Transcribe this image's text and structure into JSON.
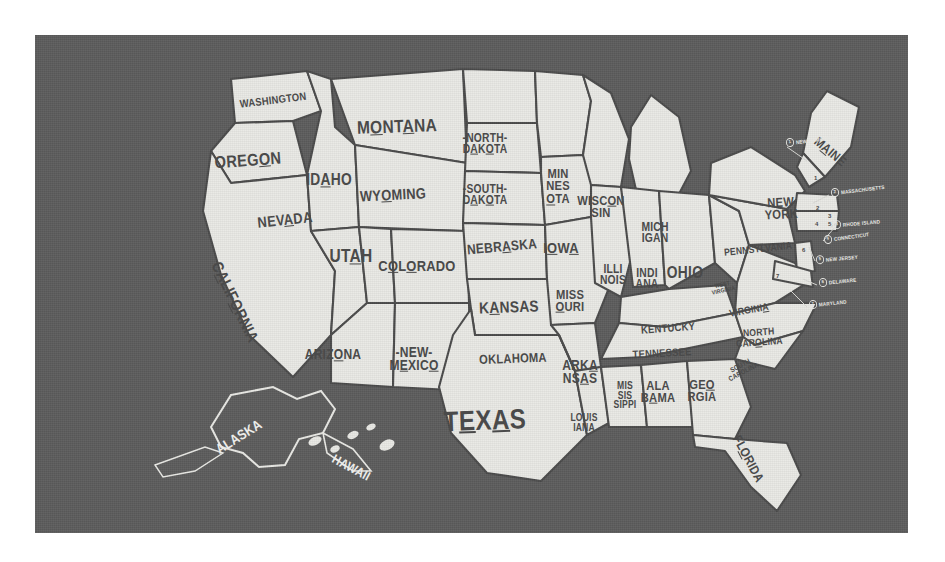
{
  "poster": {
    "title": "United States Hand-Lettered Map",
    "background_color": "#5c5c5c",
    "land_color": "#e9e9e5",
    "ink_color": "#4a4a4a",
    "inset_label_color": "#ececea",
    "margin_color": "#ffffff"
  },
  "map_data": {
    "type": "map",
    "projection": "United States (contiguous) with Alaska and Hawaii insets",
    "style": "vintage hand-lettered poster, condensed sans capitals with selected letters underlined",
    "state_count": 50,
    "states": [
      {
        "name": "WASHINGTON",
        "lines": [
          "WASHINGTON"
        ],
        "x": 238,
        "y": 65,
        "size": 11,
        "rot": -7
      },
      {
        "name": "OREGON",
        "lines": [
          "OREG<u>O</u>N"
        ],
        "x": 213,
        "y": 126,
        "size": 17,
        "rot": -4
      },
      {
        "name": "IDAHO",
        "lines": [
          "ID<u>A</u>HO"
        ],
        "x": 294,
        "y": 145,
        "size": 16,
        "rot": 0
      },
      {
        "name": "MONTANA",
        "lines": [
          "M<u>O</u>NT<u>A</u>NA"
        ],
        "x": 362,
        "y": 92,
        "size": 18,
        "rot": -2
      },
      {
        "name": "WYOMING",
        "lines": [
          "WY<u>O</u>MING"
        ],
        "x": 358,
        "y": 160,
        "size": 15,
        "rot": -3
      },
      {
        "name": "NEVADA",
        "lines": [
          "NEV<u>A</u>DA"
        ],
        "x": 250,
        "y": 185,
        "size": 15,
        "rot": -6
      },
      {
        "name": "CALIFORNIA",
        "lines": [
          "C<u>A</u>LIF<u>O</u>RNIA"
        ],
        "x": 200,
        "y": 267,
        "size": 16,
        "rot": 64
      },
      {
        "name": "UTAH",
        "lines": [
          "UT<u>A</u>H"
        ],
        "x": 316,
        "y": 222,
        "size": 18,
        "rot": 0
      },
      {
        "name": "ARIZONA",
        "lines": [
          "ARIZ<u>O</u>NA"
        ],
        "x": 298,
        "y": 320,
        "size": 14,
        "rot": 0
      },
      {
        "name": "COLORADO",
        "lines": [
          "C<u>O</u>L<u>O</u>RADO"
        ],
        "x": 382,
        "y": 231,
        "size": 15,
        "rot": 0
      },
      {
        "name": "NEW MEXICO",
        "lines": [
          "-NEW-",
          "M<u>E</u>XIC<u>O</u>"
        ],
        "x": 379,
        "y": 324,
        "size": 14,
        "rot": 0
      },
      {
        "name": "NORTH DAKOTA",
        "lines": [
          "-NORTH-",
          "D<u>A</u>K<u>O</u>TA"
        ],
        "x": 450,
        "y": 109,
        "size": 12,
        "rot": 0
      },
      {
        "name": "SOUTH DAKOTA",
        "lines": [
          "-SOUTH-",
          "D<u>A</u>K<u>O</u>TA"
        ],
        "x": 450,
        "y": 160,
        "size": 12,
        "rot": 0
      },
      {
        "name": "NEBRASKA",
        "lines": [
          "NEBR<u>A</u>SKA"
        ],
        "x": 467,
        "y": 212,
        "size": 14,
        "rot": -5
      },
      {
        "name": "KANSAS",
        "lines": [
          "K<u>A</u>NSAS"
        ],
        "x": 474,
        "y": 272,
        "size": 16,
        "rot": -2
      },
      {
        "name": "OKLAHOMA",
        "lines": [
          "OKLAHOMA"
        ],
        "x": 478,
        "y": 324,
        "size": 13,
        "rot": -2
      },
      {
        "name": "TEXAS",
        "lines": [
          "T<u>E</u>X<u>A</u>S"
        ],
        "x": 450,
        "y": 386,
        "size": 28,
        "rot": -2
      },
      {
        "name": "MINNESOTA",
        "lines": [
          "MIN",
          "NES",
          "<u>O</u>TA"
        ],
        "x": 523,
        "y": 152,
        "size": 13,
        "rot": 0
      },
      {
        "name": "IOWA",
        "lines": [
          "I<u>O</u>W<u>A</u>"
        ],
        "x": 526,
        "y": 213,
        "size": 15,
        "rot": 0
      },
      {
        "name": "MISSOURI",
        "lines": [
          "MISS",
          "<u>O</u>URI"
        ],
        "x": 535,
        "y": 266,
        "size": 13,
        "rot": 0
      },
      {
        "name": "ARKANSAS",
        "lines": [
          "ARK<u>A</u>",
          "NS<u>A</u>S"
        ],
        "x": 545,
        "y": 337,
        "size": 14,
        "rot": 0
      },
      {
        "name": "LOUISIANA",
        "lines": [
          "LOUIS",
          "IANA"
        ],
        "x": 549,
        "y": 387,
        "size": 10,
        "rot": 0
      },
      {
        "name": "WISCONSIN",
        "lines": [
          "WISC<u>O</u>N",
          "SIN"
        ],
        "x": 566,
        "y": 172,
        "size": 13,
        "rot": 0
      },
      {
        "name": "ILLINOIS",
        "lines": [
          "ILLI",
          "NOIS"
        ],
        "x": 578,
        "y": 240,
        "size": 12,
        "rot": 0
      },
      {
        "name": "MISSISSIPPI",
        "lines": [
          "MIS",
          "SIS",
          "SIPPI"
        ],
        "x": 590,
        "y": 360,
        "size": 10,
        "rot": 0
      },
      {
        "name": "MICHIGAN",
        "lines": [
          "MICH",
          "IGAN"
        ],
        "x": 620,
        "y": 198,
        "size": 12,
        "rot": 0
      },
      {
        "name": "INDIANA",
        "lines": [
          "INDI",
          "ANA"
        ],
        "x": 612,
        "y": 244,
        "size": 12,
        "rot": 0
      },
      {
        "name": "ALABAMA",
        "lines": [
          "ALA",
          "B<u>A</u>MA"
        ],
        "x": 623,
        "y": 357,
        "size": 13,
        "rot": 0
      },
      {
        "name": "OHIO",
        "lines": [
          "OHIO"
        ],
        "x": 650,
        "y": 238,
        "size": 16,
        "rot": 0
      },
      {
        "name": "KENTUCKY",
        "lines": [
          "KENTUCKY"
        ],
        "x": 633,
        "y": 293,
        "size": 11,
        "rot": -4
      },
      {
        "name": "TENNESSEE",
        "lines": [
          "TENNESSEE"
        ],
        "x": 627,
        "y": 318,
        "size": 11,
        "rot": -3
      },
      {
        "name": "GEORGIA",
        "lines": [
          "GE<u>O</u>",
          "RGIA"
        ],
        "x": 667,
        "y": 356,
        "size": 13,
        "rot": 0
      },
      {
        "name": "FLORIDA",
        "lines": [
          "FL<u>O</u>RIDA"
        ],
        "x": 713,
        "y": 424,
        "size": 13,
        "rot": 62
      },
      {
        "name": "WEST VIRGINIA",
        "lines": [
          "WEST",
          "VIRGINIA"
        ],
        "x": 688,
        "y": 253,
        "size": 6,
        "rot": -12
      },
      {
        "name": "VIRGINIA",
        "lines": [
          "VIRGINI<u>A</u>"
        ],
        "x": 714,
        "y": 275,
        "size": 10,
        "rot": -10
      },
      {
        "name": "NORTH CAROLINA",
        "lines": [
          "NORTH",
          "CAR<u>O</u>LINA"
        ],
        "x": 724,
        "y": 302,
        "size": 10,
        "rot": -4
      },
      {
        "name": "SOUTH CAROLINA",
        "lines": [
          "SOUTH",
          "CAROLINA"
        ],
        "x": 707,
        "y": 334,
        "size": 7,
        "rot": -28
      },
      {
        "name": "PENNSYLVANIA",
        "lines": [
          "PENNSYLVANIA"
        ],
        "x": 723,
        "y": 214,
        "size": 10,
        "rot": -6
      },
      {
        "name": "NEW YORK",
        "lines": [
          "NEW",
          "YORK"
        ],
        "x": 746,
        "y": 174,
        "size": 13,
        "rot": -3
      },
      {
        "name": "MAINE",
        "lines": [
          "M<u>A</u>INE"
        ],
        "x": 795,
        "y": 117,
        "size": 13,
        "rot": 40
      }
    ],
    "insets": [
      {
        "name": "ALASKA",
        "lines": [
          "ALASKA"
        ],
        "x": 204,
        "y": 402,
        "size": 14,
        "rot": -32,
        "inverted": true
      },
      {
        "name": "HAWAII",
        "lines": [
          "HAWAII"
        ],
        "x": 316,
        "y": 433,
        "size": 13,
        "rot": 28,
        "inverted": true
      }
    ],
    "callouts": [
      {
        "num": "1",
        "label": "NEW HAMPSHIRE",
        "x": 751,
        "y": 108,
        "rot": -7
      },
      {
        "num": "2",
        "label": "MASSACHUSETTS",
        "x": 796,
        "y": 158,
        "rot": -7
      },
      {
        "num": "3",
        "label": "RHODE ISLAND",
        "x": 798,
        "y": 190,
        "rot": -5
      },
      {
        "num": "4",
        "label": "CONNECTICUT",
        "x": 789,
        "y": 205,
        "rot": -8
      },
      {
        "num": "5",
        "label": "NEW JERSEY",
        "x": 781,
        "y": 225,
        "rot": -5
      },
      {
        "num": "6",
        "label": "DELAWARE",
        "x": 784,
        "y": 248,
        "rot": -6
      },
      {
        "num": "7",
        "label": "MARYLAND",
        "x": 774,
        "y": 270,
        "rot": -6
      }
    ],
    "box_numbers": [
      {
        "num": "1",
        "x": 779,
        "y": 140
      },
      {
        "num": "2",
        "x": 781,
        "y": 170
      },
      {
        "num": "3",
        "x": 793,
        "y": 178
      },
      {
        "num": "4",
        "x": 780,
        "y": 186
      },
      {
        "num": "5",
        "x": 793,
        "y": 186
      },
      {
        "num": "6",
        "x": 767,
        "y": 212
      },
      {
        "num": "7",
        "x": 741,
        "y": 238
      }
    ]
  }
}
